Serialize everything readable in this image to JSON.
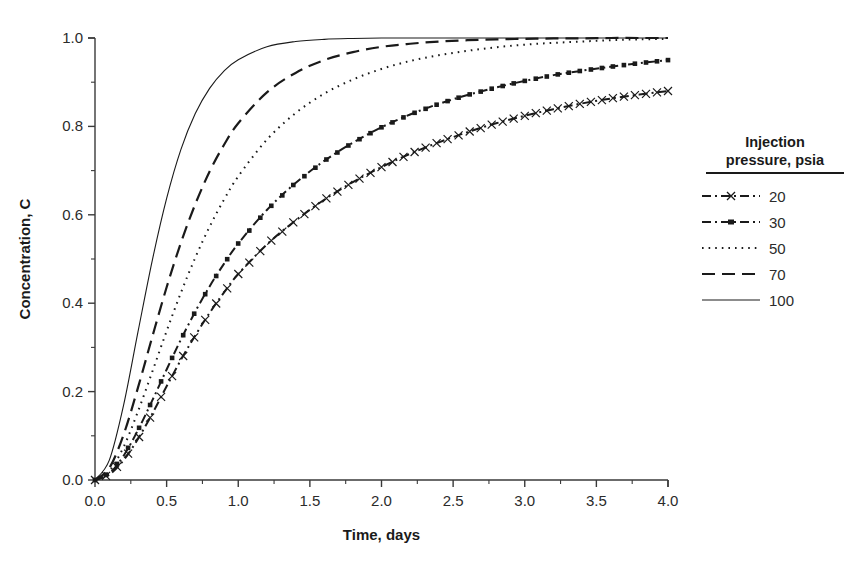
{
  "chart_data": {
    "type": "line",
    "title": "",
    "xlabel": "Time, days",
    "ylabel": "Concentration, C",
    "xlim": [
      0.0,
      4.0
    ],
    "ylim": [
      0.0,
      1.0
    ],
    "xticks": [
      "0.0",
      "0.5",
      "1.0",
      "1.5",
      "2.0",
      "2.5",
      "3.0",
      "3.5",
      "4.0"
    ],
    "yticks": [
      "0.0",
      "0.2",
      "0.4",
      "0.6",
      "0.8",
      "1.0"
    ],
    "xtick_values": [
      0.0,
      0.5,
      1.0,
      1.5,
      2.0,
      2.5,
      3.0,
      3.5,
      4.0
    ],
    "ytick_values": [
      0.0,
      0.2,
      0.4,
      0.6,
      0.8,
      1.0
    ],
    "grid": false,
    "minor_ticks": true,
    "legend_position": "right-outside",
    "legend_title": "Injection\npressure, psia",
    "x": [
      0.0,
      0.1,
      0.2,
      0.3,
      0.4,
      0.5,
      0.6,
      0.7,
      0.8,
      0.9,
      1.0,
      1.2,
      1.4,
      1.6,
      1.8,
      2.0,
      2.2,
      2.4,
      2.6,
      2.8,
      3.0,
      3.2,
      3.4,
      3.6,
      3.8,
      4.0
    ],
    "series": [
      {
        "name": "20",
        "label": "20",
        "style": "dash-dot",
        "marker": "x",
        "color": "#1a1a1a",
        "values": [
          0.0,
          0.012,
          0.045,
          0.093,
          0.15,
          0.212,
          0.272,
          0.327,
          0.378,
          0.424,
          0.466,
          0.533,
          0.587,
          0.634,
          0.674,
          0.708,
          0.738,
          0.764,
          0.787,
          0.807,
          0.824,
          0.839,
          0.852,
          0.863,
          0.872,
          0.88
        ]
      },
      {
        "name": "30",
        "label": "30",
        "style": "dash-dot",
        "marker": "filled-square",
        "color": "#1a1a1a",
        "values": [
          0.0,
          0.015,
          0.055,
          0.113,
          0.18,
          0.25,
          0.318,
          0.381,
          0.438,
          0.489,
          0.535,
          0.611,
          0.672,
          0.722,
          0.763,
          0.798,
          0.827,
          0.851,
          0.871,
          0.888,
          0.903,
          0.916,
          0.926,
          0.935,
          0.943,
          0.95
        ]
      },
      {
        "name": "50",
        "label": "50",
        "style": "dotted",
        "marker": "none",
        "color": "#1a1a1a",
        "values": [
          0.0,
          0.02,
          0.075,
          0.155,
          0.245,
          0.337,
          0.424,
          0.503,
          0.573,
          0.634,
          0.687,
          0.77,
          0.83,
          0.874,
          0.906,
          0.93,
          0.948,
          0.961,
          0.971,
          0.979,
          0.985,
          0.989,
          0.992,
          0.995,
          0.997,
          0.998
        ]
      },
      {
        "name": "70",
        "label": "70",
        "style": "dashed",
        "marker": "none",
        "color": "#1a1a1a",
        "values": [
          0.0,
          0.027,
          0.103,
          0.209,
          0.324,
          0.436,
          0.537,
          0.624,
          0.698,
          0.758,
          0.807,
          0.877,
          0.921,
          0.95,
          0.968,
          0.98,
          0.987,
          0.992,
          0.995,
          0.997,
          0.998,
          0.999,
          0.999,
          1.0,
          1.0,
          1.0
        ]
      },
      {
        "name": "100",
        "label": "100",
        "style": "solid",
        "marker": "none",
        "color": "#1a1a1a",
        "values": [
          0.0,
          0.045,
          0.17,
          0.335,
          0.497,
          0.637,
          0.748,
          0.829,
          0.886,
          0.925,
          0.951,
          0.98,
          0.992,
          0.997,
          0.999,
          1.0,
          1.0,
          1.0,
          1.0,
          1.0,
          1.0,
          1.0,
          1.0,
          1.0,
          1.0,
          1.0
        ]
      }
    ]
  },
  "legend": {
    "title_line1": "Injection",
    "title_line2": "pressure, psia",
    "entries": [
      {
        "label": "20"
      },
      {
        "label": "30"
      },
      {
        "label": "50"
      },
      {
        "label": "70"
      },
      {
        "label": "100"
      }
    ]
  },
  "axes": {
    "x_title": "Time, days",
    "y_title": "Concentration, C"
  }
}
